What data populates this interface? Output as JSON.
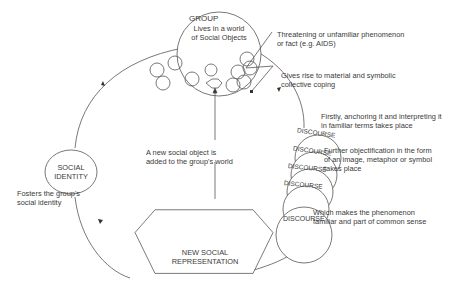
{
  "diagram": {
    "group": {
      "title": "GROUP",
      "subtitle_line1": "Lives in a world",
      "subtitle_line2": "of Social Objects"
    },
    "threat": {
      "line1": "Threatening or unfamiliar phenomenon",
      "line2": "or fact (e.g. AIDS)"
    },
    "coping": {
      "line1": "Gives rise to material and symbolic",
      "line2": "collective coping"
    },
    "anchoring": {
      "line1": "Firstly, anchoring it and interpreting it",
      "line2": "in familiar terms takes place"
    },
    "objectification": {
      "line1": "Further objectification in the form",
      "line2": "of an image, metaphor or symbol",
      "line3": "takes place"
    },
    "common_sense": {
      "line1": "Which makes the phenomenon",
      "line2": "familiar and part of common sense"
    },
    "discourse": [
      "DISCOURSE",
      "DISCOURSE",
      "DISCOURSE",
      "DISCOURSE",
      "DISCOURSE"
    ],
    "new_object": {
      "line1": "A new social object is",
      "line2": "added to the group's world"
    },
    "social_identity": {
      "line1": "SOCIAL",
      "line2": "IDENTITY"
    },
    "fosters": {
      "line1": "Fosters the group's",
      "line2": "social identity"
    },
    "new_representation": {
      "line1": "NEW SOCIAL",
      "line2": "REPRESENTATION"
    }
  }
}
